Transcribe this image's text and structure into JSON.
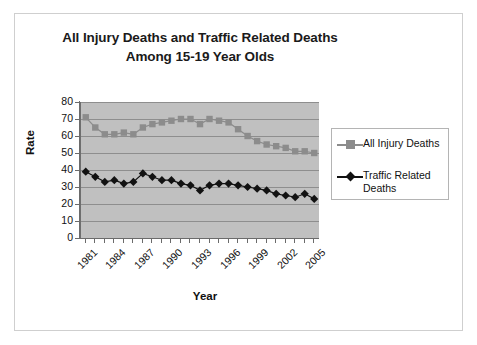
{
  "chart_data": {
    "type": "line",
    "title": "All Injury Deaths and Traffic Related Deaths",
    "subtitle": "Among 15-19 Year Olds",
    "xlabel": "Year",
    "ylabel": "Rate",
    "ylim": [
      0,
      80
    ],
    "ytick_step": 10,
    "yticks": [
      80,
      70,
      60,
      50,
      40,
      30,
      20,
      10,
      0
    ],
    "grid": true,
    "legend_position": "right",
    "x": [
      1981,
      1982,
      1983,
      1984,
      1985,
      1986,
      1987,
      1988,
      1989,
      1990,
      1991,
      1992,
      1993,
      1994,
      1995,
      1996,
      1997,
      1998,
      1999,
      2000,
      2001,
      2002,
      2003,
      2004,
      2005
    ],
    "xtick_labels": [
      "1981",
      "1984",
      "1987",
      "1990",
      "1993",
      "1996",
      "1999",
      "2002",
      "2005"
    ],
    "xtick_label_years": [
      1981,
      1984,
      1987,
      1990,
      1993,
      1996,
      1999,
      2002,
      2005
    ],
    "series": [
      {
        "name": "All Injury Deaths",
        "marker": "square",
        "color": "#8c8c8c",
        "values": [
          71,
          65,
          61,
          61,
          62,
          61,
          65,
          67,
          68,
          69,
          70,
          70,
          67,
          70,
          69,
          68,
          64,
          60,
          57,
          55,
          54,
          53,
          51,
          51,
          50
        ]
      },
      {
        "name": "Traffic Related Deaths",
        "marker": "diamond",
        "color": "#121212",
        "values": [
          39,
          36,
          33,
          34,
          32,
          33,
          38,
          36,
          34,
          34,
          32,
          31,
          28,
          31,
          32,
          32,
          31,
          30,
          29,
          28,
          26,
          25,
          24,
          26,
          23
        ]
      }
    ]
  },
  "legend": {
    "entries": [
      {
        "label": "All Injury Deaths"
      },
      {
        "label": "Traffic Related Deaths"
      }
    ]
  },
  "colors": {
    "plot_background": "#c0c0c0",
    "gridline": "#8e8e8e",
    "axis": "#6b6b6b",
    "all_injury": "#8c8c8c",
    "traffic_related": "#121212",
    "frame": "#cfcfcf"
  }
}
